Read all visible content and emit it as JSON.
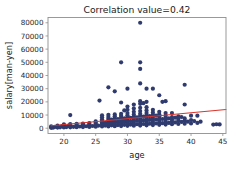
{
  "chart_data": {
    "type": "scatter",
    "title": "Correlation value=0.42",
    "xlabel": "age",
    "ylabel": "salary[man-yen]",
    "xlim": [
      17.5,
      45.5
    ],
    "ylim": [
      -4000,
      84000
    ],
    "xticks": [
      20,
      25,
      30,
      35,
      40,
      45
    ],
    "yticks": [
      0,
      10000,
      20000,
      30000,
      40000,
      50000,
      60000,
      70000,
      80000
    ],
    "grid": false,
    "legend": null,
    "point_color": "#2f3b6e",
    "point_size": 2.1,
    "series": [
      {
        "name": "salary vs age",
        "points": [
          [
            18,
            300
          ],
          [
            18,
            800
          ],
          [
            18,
            1500
          ],
          [
            18.3,
            400
          ],
          [
            18.6,
            1000
          ],
          [
            19,
            500
          ],
          [
            19,
            1200
          ],
          [
            19,
            2000
          ],
          [
            19.4,
            700
          ],
          [
            19.7,
            1600
          ],
          [
            20,
            600
          ],
          [
            20,
            1400
          ],
          [
            20,
            2200
          ],
          [
            20,
            3000
          ],
          [
            20.4,
            900
          ],
          [
            20.7,
            1800
          ],
          [
            21,
            700
          ],
          [
            21,
            1500
          ],
          [
            21,
            2400
          ],
          [
            21,
            3200
          ],
          [
            21,
            10000
          ],
          [
            21.5,
            1100
          ],
          [
            22,
            800
          ],
          [
            22,
            1700
          ],
          [
            22,
            2600
          ],
          [
            22,
            3400
          ],
          [
            22.5,
            1300
          ],
          [
            23,
            900
          ],
          [
            23,
            1900
          ],
          [
            23,
            2800
          ],
          [
            23,
            3600
          ],
          [
            23.5,
            1500
          ],
          [
            24,
            1000
          ],
          [
            24,
            2100
          ],
          [
            24,
            3000
          ],
          [
            24,
            3900
          ],
          [
            24.5,
            1700
          ],
          [
            25,
            1200
          ],
          [
            25,
            2300
          ],
          [
            25,
            3300
          ],
          [
            25,
            4200
          ],
          [
            25,
            5200
          ],
          [
            25.4,
            1900
          ],
          [
            25.6,
            21000
          ],
          [
            26,
            1300
          ],
          [
            26,
            2500
          ],
          [
            26,
            3600
          ],
          [
            26,
            4600
          ],
          [
            26,
            5600
          ],
          [
            26,
            6800
          ],
          [
            26,
            8400
          ],
          [
            26,
            9800
          ],
          [
            26.5,
            2000
          ],
          [
            26.5,
            4000
          ],
          [
            27,
            1400
          ],
          [
            27,
            2700
          ],
          [
            27,
            3800
          ],
          [
            27,
            4900
          ],
          [
            27,
            6000
          ],
          [
            27,
            7200
          ],
          [
            27,
            8600
          ],
          [
            27,
            10200
          ],
          [
            27,
            31000
          ],
          [
            27.5,
            2200
          ],
          [
            27.5,
            4300
          ],
          [
            27.5,
            6500
          ],
          [
            28,
            1500
          ],
          [
            28,
            2900
          ],
          [
            28,
            4000
          ],
          [
            28,
            5100
          ],
          [
            28,
            6300
          ],
          [
            28,
            7600
          ],
          [
            28,
            9000
          ],
          [
            28,
            10500
          ],
          [
            28,
            28000
          ],
          [
            28.5,
            2400
          ],
          [
            28.5,
            4600
          ],
          [
            28.5,
            7000
          ],
          [
            29,
            1600
          ],
          [
            29,
            3000
          ],
          [
            29,
            4200
          ],
          [
            29,
            5400
          ],
          [
            29,
            6600
          ],
          [
            29,
            8000
          ],
          [
            29,
            9400
          ],
          [
            29,
            11000
          ],
          [
            29,
            19500
          ],
          [
            29,
            50000
          ],
          [
            29.5,
            2600
          ],
          [
            29.5,
            5000
          ],
          [
            29.5,
            7400
          ],
          [
            29.5,
            13500
          ],
          [
            30,
            1800
          ],
          [
            30,
            3200
          ],
          [
            30,
            4400
          ],
          [
            30,
            5600
          ],
          [
            30,
            7000
          ],
          [
            30,
            8400
          ],
          [
            30,
            9800
          ],
          [
            30,
            11500
          ],
          [
            30,
            14000
          ],
          [
            30,
            16500
          ],
          [
            30,
            30000
          ],
          [
            30.5,
            2800
          ],
          [
            30.5,
            5300
          ],
          [
            30.5,
            7900
          ],
          [
            31,
            1900
          ],
          [
            31,
            3400
          ],
          [
            31,
            4700
          ],
          [
            31,
            6000
          ],
          [
            31,
            7400
          ],
          [
            31,
            8900
          ],
          [
            31,
            10400
          ],
          [
            31,
            12500
          ],
          [
            31,
            15000
          ],
          [
            31,
            18000
          ],
          [
            31.5,
            3000
          ],
          [
            31.5,
            5600
          ],
          [
            31.5,
            8300
          ],
          [
            32,
            2000
          ],
          [
            32,
            3600
          ],
          [
            32,
            5000
          ],
          [
            32,
            6400
          ],
          [
            32,
            7800
          ],
          [
            32,
            9400
          ],
          [
            32,
            11000
          ],
          [
            32,
            13000
          ],
          [
            32,
            15500
          ],
          [
            32,
            18500
          ],
          [
            32,
            20500
          ],
          [
            32,
            34000
          ],
          [
            32,
            45000
          ],
          [
            32,
            50000
          ],
          [
            32,
            80000
          ],
          [
            32.5,
            3200
          ],
          [
            32.5,
            6000
          ],
          [
            32.5,
            8800
          ],
          [
            32.5,
            19000
          ],
          [
            33,
            2200
          ],
          [
            33,
            3800
          ],
          [
            33,
            5200
          ],
          [
            33,
            6700
          ],
          [
            33,
            8200
          ],
          [
            33,
            9800
          ],
          [
            33,
            11500
          ],
          [
            33,
            13500
          ],
          [
            33,
            16000
          ],
          [
            33,
            20000
          ],
          [
            33,
            30000
          ],
          [
            33.5,
            3400
          ],
          [
            33.5,
            6300
          ],
          [
            33.5,
            9200
          ],
          [
            34,
            2400
          ],
          [
            34,
            4000
          ],
          [
            34,
            5500
          ],
          [
            34,
            7000
          ],
          [
            34,
            8600
          ],
          [
            34,
            10200
          ],
          [
            34,
            12000
          ],
          [
            34,
            14000
          ],
          [
            34,
            30000
          ],
          [
            34.5,
            3600
          ],
          [
            34.5,
            6600
          ],
          [
            34.5,
            9600
          ],
          [
            35,
            2600
          ],
          [
            35,
            4300
          ],
          [
            35,
            5800
          ],
          [
            35,
            7400
          ],
          [
            35,
            9000
          ],
          [
            35,
            10600
          ],
          [
            35,
            12500
          ],
          [
            35,
            25000
          ],
          [
            35.5,
            3800
          ],
          [
            35.5,
            7000
          ],
          [
            35.5,
            20000
          ],
          [
            36,
            2800
          ],
          [
            36,
            4600
          ],
          [
            36,
            6200
          ],
          [
            36,
            7800
          ],
          [
            36,
            9500
          ],
          [
            36,
            11500
          ],
          [
            36,
            20500
          ],
          [
            36.5,
            4000
          ],
          [
            36.5,
            7400
          ],
          [
            37,
            3000
          ],
          [
            37,
            5000
          ],
          [
            37,
            6600
          ],
          [
            37,
            8400
          ],
          [
            37,
            11500
          ],
          [
            37.5,
            4400
          ],
          [
            37.5,
            8000
          ],
          [
            38,
            3200
          ],
          [
            38,
            5400
          ],
          [
            38,
            7000
          ],
          [
            38,
            9000
          ],
          [
            38.5,
            4800
          ],
          [
            38.5,
            8500
          ],
          [
            39,
            3400
          ],
          [
            39,
            5800
          ],
          [
            39,
            7400
          ],
          [
            39,
            18000
          ],
          [
            39,
            33000
          ],
          [
            39.5,
            5000
          ],
          [
            40,
            3600
          ],
          [
            40,
            6200
          ],
          [
            40,
            9500
          ],
          [
            40.5,
            5400
          ],
          [
            41,
            4000
          ],
          [
            41,
            9500
          ],
          [
            41.5,
            5000
          ],
          [
            43.5,
            2800
          ],
          [
            44,
            3000
          ],
          [
            44.5,
            2900
          ]
        ]
      }
    ],
    "trendline": {
      "color": "#d8342a",
      "x_start": 18.0,
      "y_start": 1800,
      "x_end": 45.5,
      "y_end": 14200
    }
  }
}
